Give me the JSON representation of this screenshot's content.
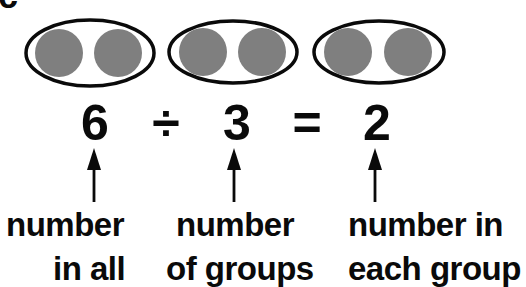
{
  "panel_label": "c",
  "groups": [
    {
      "circles": 2
    },
    {
      "circles": 2
    },
    {
      "circles": 2
    }
  ],
  "colors": {
    "circle_fill": "#7f7f7f",
    "oval_stroke": "#0a0a0a",
    "text": "#0a0a0a",
    "background": "#ffffff"
  },
  "equation": {
    "dividend": "6",
    "operator": "÷",
    "divisor": "3",
    "equals": "=",
    "quotient": "2"
  },
  "labels": {
    "dividend": {
      "line1": "number",
      "line2": "in all"
    },
    "divisor": {
      "line1": "number",
      "line2": "of groups"
    },
    "quotient": {
      "line1": "number in",
      "line2": "each group"
    }
  }
}
